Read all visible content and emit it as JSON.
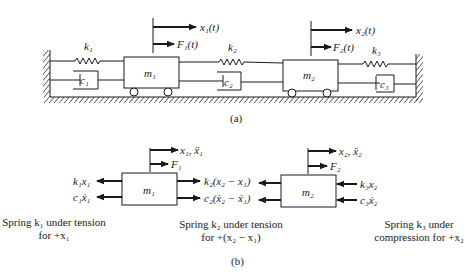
{
  "figure": {
    "part_a": {
      "label": "(a)",
      "masses": [
        "m₁",
        "m₂"
      ],
      "springs": [
        "k₁",
        "k₂",
        "k₃"
      ],
      "dampers": [
        "c₁",
        "c₂",
        "c₃"
      ],
      "displacements": [
        "x₁(t)",
        "x₂(t)"
      ],
      "forces": [
        "F₁(t)",
        "F₂(t)"
      ]
    },
    "part_b": {
      "label": "(b)",
      "m1": {
        "mass": "m₁",
        "motion": "x₁, ẍ₁",
        "force": "F₁",
        "left_forces": [
          "k₁x₁",
          "c₁ẋ₁"
        ],
        "right_forces": [
          "k₂(x₂ − x₁)",
          "c₂(ẋ₂ − ẋ₁)"
        ]
      },
      "m2": {
        "mass": "m₂",
        "motion": "x₂, ẍ₂",
        "force": "F₂",
        "left_forces": [
          "k₂(x₂ − x₁)",
          "c₂(ẋ₂ − ẋ₁)"
        ],
        "right_forces": [
          "k₃x₂",
          "c₃ẋ₂"
        ]
      },
      "captions": [
        {
          "line1": "Spring k₁ under tension",
          "line2": "for +x₁"
        },
        {
          "line1": "Spring k₂ under tension",
          "line2": "for +(x₂ − x₁)"
        },
        {
          "line1": "Spring k₃ under",
          "line2": "compression for +x₂"
        }
      ]
    }
  }
}
